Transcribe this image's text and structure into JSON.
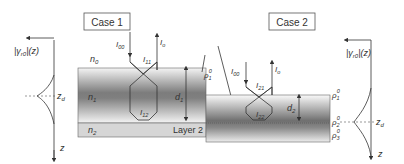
{
  "case1": {
    "title": "Case 1",
    "profile_label": "|γ",
    "profile_sub": "r0",
    "profile_tail": "|(z)",
    "zd_label": "z",
    "zd_sub": "d",
    "z_axis_label": "z",
    "n0": "n",
    "n0_sub": "0",
    "n1": "n",
    "n1_sub": "1",
    "n2": "n",
    "n2_sub": "2",
    "I00": "I",
    "I00_sub": "00",
    "Io": "I",
    "Io_sub": "o",
    "I11": "I",
    "I11_sub": "11",
    "I12": "I",
    "I12_sub": "12",
    "d1": "d",
    "d1_sub": "1",
    "rho1": "ρ",
    "rho1_sub": "1",
    "rho1_sup": "0",
    "layer2": "Layer 2"
  },
  "case2": {
    "title": "Case 2",
    "profile_label": "|γ",
    "profile_sub": "r0",
    "profile_tail": "|(z)",
    "zd_label": "z",
    "zd_sub": "d",
    "z_axis_label": "z",
    "I00": "I",
    "I00_sub": "00",
    "Io": "I",
    "Io_sub": "o",
    "I21": "I",
    "I21_sub": "21",
    "I22": "I",
    "I22_sub": "22",
    "d2": "d",
    "d2_sub": "2",
    "rho1": "ρ",
    "rho1_sub": "1",
    "rho1_sup": "0",
    "rho2": "ρ",
    "rho2_sub": "2",
    "rho2_sup": "0",
    "rho3": "ρ",
    "rho3_sub": "3",
    "rho3_sup": "0"
  },
  "colors": {
    "line": "#333333",
    "box_border": "#555555",
    "slab_dark": "#7a7a7a",
    "slab_light": "#f2f2f2",
    "layer2": "#d6d6d6"
  }
}
